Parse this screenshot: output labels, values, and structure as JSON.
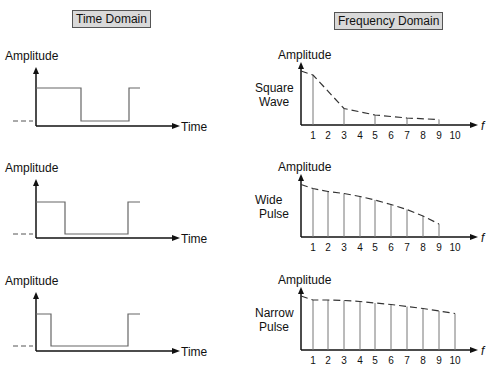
{
  "titles": {
    "time": "Time Domain",
    "frequency": "Frequency Domain"
  },
  "axis_labels": {
    "amplitude": "Amplitude",
    "time": "Time",
    "frequency": "f"
  },
  "rows": [
    {
      "label_line1": "Square",
      "label_line2": "Wave",
      "axis_y": 126,
      "fy": 125,
      "pulse": {
        "high": 88,
        "low": 121,
        "fall": 81,
        "rise": 129
      },
      "harmonics": [
        1,
        3,
        5,
        7,
        9
      ],
      "heights": [
        1.0,
        0.33,
        0.2,
        0.14,
        0.11
      ]
    },
    {
      "label_line1": "Wide",
      "label_line2": "Pulse",
      "axis_y": 238,
      "fy": 237,
      "pulse": {
        "high": 202,
        "low": 234,
        "fall": 65,
        "rise": 128
      },
      "harmonics": [
        1,
        2,
        3,
        4,
        5,
        6,
        7,
        8,
        9
      ],
      "heights": [
        0.97,
        0.91,
        0.87,
        0.81,
        0.74,
        0.65,
        0.55,
        0.42,
        0.26
      ]
    },
    {
      "label_line1": "Narrow",
      "label_line2": "Pulse",
      "axis_y": 351,
      "fy": 350,
      "pulse": {
        "high": 314,
        "low": 346,
        "fall": 51,
        "rise": 128
      },
      "harmonics": [
        1,
        2,
        3,
        4,
        5,
        6,
        7,
        8,
        9,
        10
      ],
      "heights": [
        1.0,
        1.0,
        0.99,
        0.97,
        0.94,
        0.91,
        0.87,
        0.83,
        0.78,
        0.73
      ]
    }
  ],
  "ticks": [
    "1",
    "2",
    "3",
    "4",
    "5",
    "6",
    "7",
    "8",
    "9",
    "10"
  ]
}
